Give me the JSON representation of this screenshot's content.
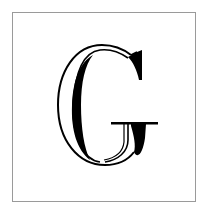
{
  "letter": {
    "character": "G",
    "style": "inline-serif",
    "color": "#000000"
  },
  "frame": {
    "border_color": "#9a9a9a",
    "background": "#ffffff"
  }
}
